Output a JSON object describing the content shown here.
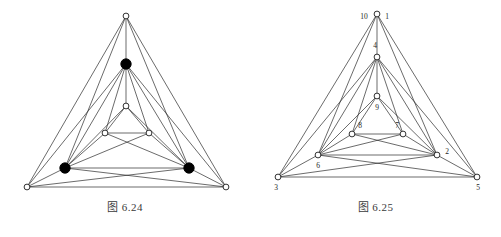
{
  "page": {
    "background_color": "#ffffff",
    "width": 501,
    "height": 237
  },
  "figures": [
    {
      "id": "figure-6-24",
      "caption": "图 6.24",
      "description": "Planar graph drawing with nested triangles, three solid black vertices and six open vertices"
    },
    {
      "id": "figure-6-25",
      "caption": "图 6.25",
      "description": "Planar graph drawing with nested triangles and numbered open vertices"
    }
  ],
  "colors": {
    "edge": "#2b2b2b",
    "node_open_fill": "#ffffff",
    "node_open_stroke": "#1c1c1c",
    "node_filled": "#000000",
    "label": "#262626",
    "caption": "#3a3a3a"
  },
  "chart_data": [
    {
      "type": "diagram",
      "title": "图 6.24",
      "graph_kind": "planar-graph",
      "nodes": [
        {
          "id": "t",
          "x": 126,
          "y": 16,
          "style": "open",
          "label": ""
        },
        {
          "id": "a",
          "x": 126,
          "y": 64,
          "style": "filled",
          "label": ""
        },
        {
          "id": "m",
          "x": 126,
          "y": 106,
          "style": "open",
          "label": ""
        },
        {
          "id": "il",
          "x": 105,
          "y": 133,
          "style": "open",
          "label": ""
        },
        {
          "id": "ir",
          "x": 149,
          "y": 133,
          "style": "open",
          "label": ""
        },
        {
          "id": "bl",
          "x": 65,
          "y": 168,
          "style": "filled",
          "label": ""
        },
        {
          "id": "br",
          "x": 189,
          "y": 168,
          "style": "filled",
          "label": ""
        },
        {
          "id": "ol",
          "x": 27,
          "y": 187,
          "style": "open",
          "label": ""
        },
        {
          "id": "or",
          "x": 226,
          "y": 187,
          "style": "open",
          "label": ""
        }
      ],
      "edges": [
        [
          "t",
          "a"
        ],
        [
          "t",
          "bl"
        ],
        [
          "t",
          "br"
        ],
        [
          "t",
          "ol"
        ],
        [
          "t",
          "or"
        ],
        [
          "a",
          "m"
        ],
        [
          "a",
          "il"
        ],
        [
          "a",
          "ir"
        ],
        [
          "a",
          "bl"
        ],
        [
          "a",
          "br"
        ],
        [
          "a",
          "ol"
        ],
        [
          "a",
          "or"
        ],
        [
          "m",
          "il"
        ],
        [
          "m",
          "ir"
        ],
        [
          "m",
          "bl"
        ],
        [
          "m",
          "br"
        ],
        [
          "il",
          "ir"
        ],
        [
          "il",
          "bl"
        ],
        [
          "il",
          "br"
        ],
        [
          "ir",
          "br"
        ],
        [
          "ir",
          "bl"
        ],
        [
          "bl",
          "br"
        ],
        [
          "bl",
          "ol"
        ],
        [
          "bl",
          "or"
        ],
        [
          "br",
          "or"
        ],
        [
          "br",
          "ol"
        ],
        [
          "ol",
          "or"
        ]
      ]
    },
    {
      "type": "diagram",
      "title": "图 6.25",
      "graph_kind": "planar-graph",
      "nodes": [
        {
          "id": "n1",
          "x": 127,
          "y": 14,
          "style": "open",
          "label": "1",
          "label_dx": 10,
          "label_dy": 3
        },
        {
          "id": "n10",
          "x": 127,
          "y": 14,
          "style": "none",
          "label": "10",
          "label_dx": -13,
          "label_dy": 3
        },
        {
          "id": "n4",
          "x": 127,
          "y": 57,
          "style": "open",
          "label": "4",
          "label_dx": -2,
          "label_dy": -11
        },
        {
          "id": "n9",
          "x": 127,
          "y": 96,
          "style": "open",
          "label": "9",
          "label_dx": 0,
          "label_dy": 12
        },
        {
          "id": "n8",
          "x": 102,
          "y": 134,
          "style": "open",
          "label": "8",
          "label_dx": 8,
          "label_dy": -8
        },
        {
          "id": "n7",
          "x": 153,
          "y": 134,
          "style": "open",
          "label": "7",
          "label_dx": -6,
          "label_dy": -8
        },
        {
          "id": "n6",
          "x": 68,
          "y": 155,
          "style": "open",
          "label": "6",
          "label_dx": 0,
          "label_dy": 11
        },
        {
          "id": "n2",
          "x": 187,
          "y": 155,
          "style": "open",
          "label": "2",
          "label_dx": 10,
          "label_dy": -3
        },
        {
          "id": "n3",
          "x": 28,
          "y": 177,
          "style": "open",
          "label": "3",
          "label_dx": -2,
          "label_dy": 11
        },
        {
          "id": "n5",
          "x": 227,
          "y": 177,
          "style": "open",
          "label": "5",
          "label_dx": 1,
          "label_dy": 11
        }
      ],
      "edges": [
        [
          "n1",
          "n4"
        ],
        [
          "n1",
          "n6"
        ],
        [
          "n1",
          "n2"
        ],
        [
          "n1",
          "n3"
        ],
        [
          "n1",
          "n5"
        ],
        [
          "n4",
          "n9"
        ],
        [
          "n4",
          "n8"
        ],
        [
          "n4",
          "n7"
        ],
        [
          "n4",
          "n6"
        ],
        [
          "n4",
          "n2"
        ],
        [
          "n4",
          "n3"
        ],
        [
          "n4",
          "n5"
        ],
        [
          "n9",
          "n8"
        ],
        [
          "n9",
          "n7"
        ],
        [
          "n9",
          "n6"
        ],
        [
          "n9",
          "n2"
        ],
        [
          "n8",
          "n7"
        ],
        [
          "n8",
          "n6"
        ],
        [
          "n8",
          "n2"
        ],
        [
          "n7",
          "n2"
        ],
        [
          "n7",
          "n6"
        ],
        [
          "n6",
          "n2"
        ],
        [
          "n6",
          "n3"
        ],
        [
          "n6",
          "n5"
        ],
        [
          "n2",
          "n5"
        ],
        [
          "n2",
          "n3"
        ],
        [
          "n3",
          "n5"
        ]
      ]
    }
  ]
}
